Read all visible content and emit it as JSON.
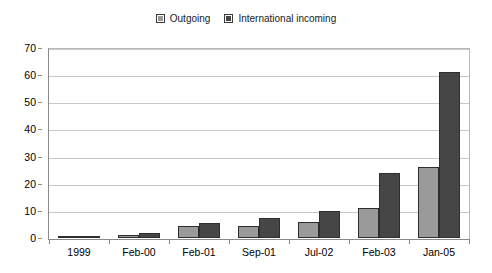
{
  "chart_data": {
    "type": "bar",
    "title": "",
    "subtitle": "",
    "xlabel": "",
    "ylabel": "",
    "categories": [
      "1999",
      "Feb-00",
      "Feb-01",
      "Sep-01",
      "Jul-02",
      "Feb-03",
      "Jan-05"
    ],
    "series": [
      {
        "name": "Outgoing",
        "color": "#9a9a9a",
        "values": [
          0.5,
          1,
          4.5,
          4.5,
          6,
          11,
          26
        ]
      },
      {
        "name": "International incoming",
        "color": "#464646",
        "values": [
          0.8,
          2,
          5.5,
          7.5,
          10,
          24,
          61
        ]
      }
    ],
    "ylim": [
      0,
      70
    ],
    "yticks": [
      0,
      10,
      20,
      30,
      40,
      50,
      60,
      70
    ],
    "ytick_labels": [
      "0",
      "10",
      "20",
      "30",
      "40",
      "50",
      "60",
      "70"
    ],
    "grid": true,
    "grid_axis": "y",
    "legend_position": "top-center",
    "bar_border_color": "#2e2e2e",
    "gridline_color": "#c9c9c9",
    "axis_color": "#8a8a8a",
    "background_color": "#ffffff"
  },
  "legend": {
    "entries": [
      {
        "label": "Outgoing",
        "swatch_name": "legend-swatch-outgoing"
      },
      {
        "label": "International incoming",
        "swatch_name": "legend-swatch-international-incoming"
      }
    ]
  }
}
